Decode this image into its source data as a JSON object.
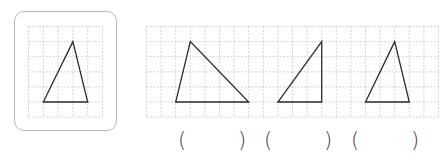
{
  "reference_figure": {
    "label": "reference triangle",
    "grid": {
      "cols": 5,
      "rows": 6
    },
    "vertices": [
      [
        3,
        1
      ],
      [
        1,
        5
      ],
      [
        4,
        5
      ]
    ]
  },
  "options_grid": {
    "cols": 20,
    "rows": 6,
    "triangles": [
      {
        "name": "option-triangle-1",
        "vertices": [
          [
            3,
            1
          ],
          [
            2,
            5
          ],
          [
            7,
            5
          ]
        ]
      },
      {
        "name": "option-triangle-2",
        "vertices": [
          [
            12,
            1
          ],
          [
            9,
            5
          ],
          [
            12,
            5
          ]
        ]
      },
      {
        "name": "option-triangle-3",
        "vertices": [
          [
            17,
            1
          ],
          [
            15,
            5
          ],
          [
            18,
            5
          ]
        ]
      }
    ]
  },
  "answer_blanks": [
    {
      "open": "(",
      "close": ")",
      "value": ""
    },
    {
      "open": "(",
      "close": ")",
      "value": ""
    },
    {
      "open": "(",
      "close": ")",
      "value": ""
    }
  ],
  "colors": {
    "grid_line": "#c8c8c8",
    "triangle_stroke": "#2a2a2a",
    "box_border": "#b8b8b8"
  }
}
